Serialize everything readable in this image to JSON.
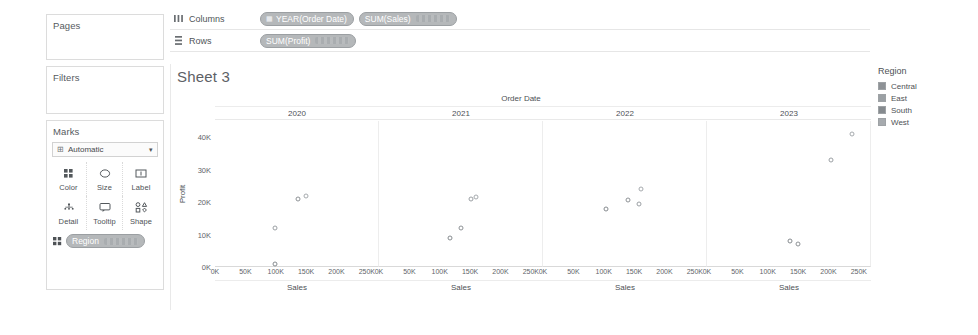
{
  "shelves": {
    "columns": {
      "label": "Columns",
      "icon": "columns-icon",
      "pills": [
        {
          "text": "YEAR(Order Date)",
          "icon": "calendar-icon",
          "kind": "discrete"
        },
        {
          "text": "SUM(Sales)",
          "icon": "",
          "kind": "continuous"
        }
      ]
    },
    "rows": {
      "label": "Rows",
      "icon": "rows-icon",
      "pills": [
        {
          "text": "SUM(Profit)",
          "icon": "",
          "kind": "continuous"
        }
      ]
    }
  },
  "cards": {
    "pages": {
      "title": "Pages"
    },
    "filters": {
      "title": "Filters"
    },
    "marks": {
      "title": "Marks",
      "mark_type": "Automatic",
      "buttons": [
        {
          "label": "Color",
          "icon": "color-icon"
        },
        {
          "label": "Size",
          "icon": "size-icon"
        },
        {
          "label": "Label",
          "icon": "label-icon"
        },
        {
          "label": "Detail",
          "icon": "detail-icon"
        },
        {
          "label": "Tooltip",
          "icon": "tooltip-icon"
        },
        {
          "label": "Shape",
          "icon": "shape-icon"
        }
      ],
      "encoding_pills": [
        {
          "text": "Region",
          "icon": "color-icon"
        }
      ]
    }
  },
  "worksheet": {
    "title": "Sheet 3"
  },
  "legend": {
    "title": "Region",
    "items": [
      {
        "label": "Central",
        "color": "#8e9296"
      },
      {
        "label": "East",
        "color": "#9ba0a4"
      },
      {
        "label": "South",
        "color": "#868b8f"
      },
      {
        "label": "West",
        "color": "#a6aaae"
      }
    ]
  },
  "chart_data": {
    "type": "scatter",
    "title": "Sheet 3",
    "column_field_label": "Order Date",
    "xlabel": "Sales",
    "ylabel": "Profit",
    "ylim": [
      0,
      45000
    ],
    "ytick_labels": [
      "0K",
      "10K",
      "20K",
      "30K",
      "40K"
    ],
    "ytick_values": [
      0,
      10000,
      20000,
      30000,
      40000
    ],
    "xlim": [
      0,
      270000
    ],
    "xtick_labels": [
      "0K",
      "50K",
      "100K",
      "150K",
      "200K",
      "250K"
    ],
    "xtick_values": [
      0,
      50000,
      100000,
      150000,
      200000,
      250000
    ],
    "grid": false,
    "legend_position": "right",
    "color_field": "Region",
    "panels": [
      {
        "year": "2020",
        "points": [
          {
            "region": "South",
            "sales": 100000,
            "profit": 1000
          },
          {
            "region": "East",
            "sales": 100000,
            "profit": 12000
          },
          {
            "region": "Central",
            "sales": 137000,
            "profit": 21000
          },
          {
            "region": "West",
            "sales": 150000,
            "profit": 22000
          }
        ]
      },
      {
        "year": "2021",
        "points": [
          {
            "region": "South",
            "sales": 118000,
            "profit": 9000
          },
          {
            "region": "Central",
            "sales": 135000,
            "profit": 12000
          },
          {
            "region": "East",
            "sales": 152000,
            "profit": 21000
          },
          {
            "region": "West",
            "sales": 161000,
            "profit": 21500
          }
        ]
      },
      {
        "year": "2022",
        "points": [
          {
            "region": "South",
            "sales": 105000,
            "profit": 18000
          },
          {
            "region": "Central",
            "sales": 140000,
            "profit": 20500
          },
          {
            "region": "East",
            "sales": 159000,
            "profit": 19500
          },
          {
            "region": "West",
            "sales": 163000,
            "profit": 24000
          }
        ]
      },
      {
        "year": "2023",
        "points": [
          {
            "region": "South",
            "sales": 138000,
            "profit": 8000
          },
          {
            "region": "Central",
            "sales": 151000,
            "profit": 7000
          },
          {
            "region": "East",
            "sales": 205000,
            "profit": 33000
          },
          {
            "region": "West",
            "sales": 241000,
            "profit": 41000
          }
        ]
      }
    ]
  }
}
